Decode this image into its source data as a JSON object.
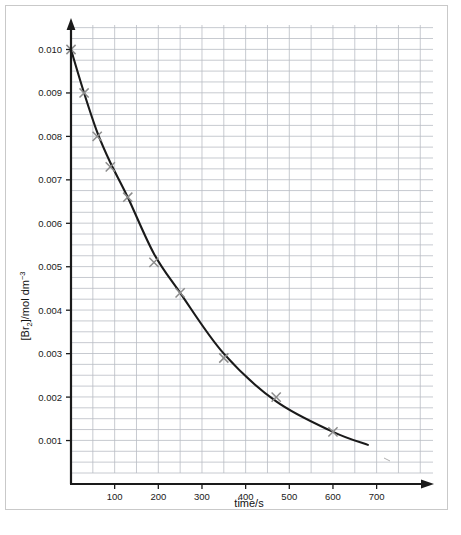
{
  "figure": {
    "background_color": "#ffffff",
    "frame_color": "#c9c9c9",
    "curve_color": "#1a1a1a",
    "marker_color": "#8c8c8c",
    "grid_color": "#b9bcc4",
    "axis_color": "#1a1a1a"
  },
  "axis_titles": {
    "x": "time/s",
    "y_prefix": "[Br",
    "y_sub": "2",
    "y_mid": "]/mol dm",
    "y_sup": "−3"
  },
  "chart_data": {
    "type": "scatter",
    "title": "",
    "xlabel": "time/s",
    "ylabel": "[Br2]/mol dm-3",
    "xlim": [
      0,
      780
    ],
    "ylim": [
      0,
      0.0105
    ],
    "grid": true,
    "grid_x_step": 50,
    "grid_y_step": 0.00025,
    "legend": "none",
    "x_ticks": [
      100,
      200,
      300,
      400,
      500,
      600,
      700
    ],
    "x_tick_labels": [
      "100",
      "200",
      "300",
      "400",
      "500",
      "600",
      "700"
    ],
    "y_ticks": [
      0.001,
      0.002,
      0.003,
      0.004,
      0.005,
      0.006,
      0.007,
      0.008,
      0.009,
      0.01
    ],
    "y_tick_labels": [
      "0.001",
      "0.002",
      "0.003",
      "0.004",
      "0.005",
      "0.006",
      "0.007",
      "0.008",
      "0.009",
      "0.010"
    ],
    "series": [
      {
        "name": "[Br2] vs time",
        "marker": "x",
        "x": [
          0,
          30,
          60,
          90,
          130,
          190,
          250,
          350,
          470,
          600
        ],
        "y": [
          0.01,
          0.009,
          0.008,
          0.0073,
          0.0066,
          0.0051,
          0.0044,
          0.0029,
          0.002,
          0.0012
        ]
      }
    ],
    "fit_curve": {
      "name": "best-fit decay curve",
      "x": [
        0,
        30,
        60,
        90,
        130,
        190,
        250,
        350,
        470,
        600,
        680
      ],
      "y": [
        0.01,
        0.009,
        0.0081,
        0.0074,
        0.0066,
        0.0053,
        0.0044,
        0.003,
        0.0019,
        0.0012,
        0.0009
      ]
    }
  }
}
